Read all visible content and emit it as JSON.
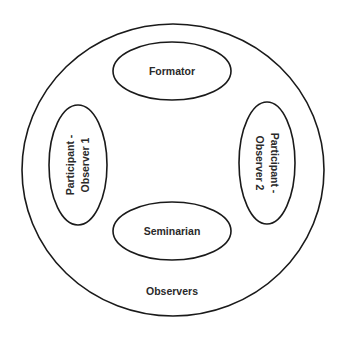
{
  "diagram": {
    "outer": {
      "label": "Observers"
    },
    "nodes": [
      {
        "id": "formator",
        "label": "Formator"
      },
      {
        "id": "participant-observer-1",
        "lines": [
          "Participant -",
          "Observer 1"
        ]
      },
      {
        "id": "participant-observer-2",
        "lines": [
          "Participant -",
          "Observer 2"
        ]
      },
      {
        "id": "seminarian",
        "label": "Seminarian"
      }
    ],
    "colors": {
      "stroke": "#1a1a1a",
      "text": "#2a2a2a",
      "background": "#ffffff"
    }
  }
}
